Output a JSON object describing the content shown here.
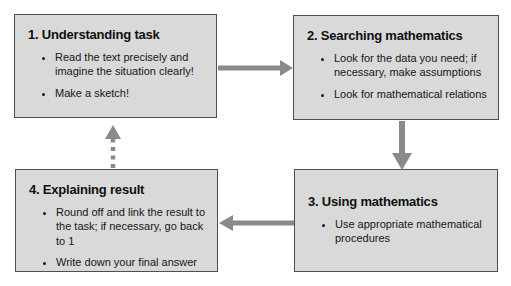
{
  "diagram": {
    "boxes": [
      {
        "number": "1",
        "title": "1. Understanding task",
        "bullets": [
          "Read the text precisely and imagine the situation clearly!",
          "Make a sketch!"
        ]
      },
      {
        "number": "2",
        "title": "2. Searching mathematics",
        "bullets": [
          "Look for the data you need; if necessary, make assumptions",
          "Look for mathematical relations"
        ]
      },
      {
        "number": "3",
        "title": "3. Using mathematics",
        "bullets": [
          "Use appropriate mathematical procedures"
        ]
      },
      {
        "number": "4",
        "title": "4. Explaining result",
        "bullets": [
          "Round off and link the result to the task; if necessary, go back to 1",
          "Write down your final answer"
        ]
      }
    ],
    "arrows": [
      {
        "from": "1",
        "to": "2",
        "style": "solid",
        "direction": "right"
      },
      {
        "from": "2",
        "to": "3",
        "style": "solid",
        "direction": "down"
      },
      {
        "from": "3",
        "to": "4",
        "style": "solid",
        "direction": "left"
      },
      {
        "from": "4",
        "to": "1",
        "style": "dashed",
        "direction": "up"
      }
    ],
    "colors": {
      "box_fill": "#d9d9d9",
      "box_border": "#4f4f4f",
      "arrow": "#8a8a8a",
      "text": "#111111",
      "background": "#ffffff"
    }
  }
}
